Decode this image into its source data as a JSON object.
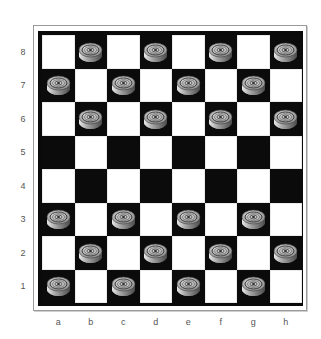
{
  "board": {
    "files": [
      "a",
      "b",
      "c",
      "d",
      "e",
      "f",
      "g",
      "h"
    ],
    "ranks": [
      "8",
      "7",
      "6",
      "5",
      "4",
      "3",
      "2",
      "1"
    ],
    "colors": {
      "light_square": "#ffffff",
      "dark_square": "#0b0b0b",
      "frame": "#9a9a9a",
      "piece_top": "#bdbdbd",
      "piece_rim": "#8a8a8a"
    },
    "pieces": [
      {
        "square": "b8",
        "type": "man"
      },
      {
        "square": "d8",
        "type": "man"
      },
      {
        "square": "f8",
        "type": "man"
      },
      {
        "square": "h8",
        "type": "man"
      },
      {
        "square": "a7",
        "type": "man"
      },
      {
        "square": "c7",
        "type": "man"
      },
      {
        "square": "e7",
        "type": "man"
      },
      {
        "square": "g7",
        "type": "man"
      },
      {
        "square": "b6",
        "type": "man"
      },
      {
        "square": "d6",
        "type": "man"
      },
      {
        "square": "f6",
        "type": "man"
      },
      {
        "square": "h6",
        "type": "man"
      },
      {
        "square": "a3",
        "type": "man"
      },
      {
        "square": "c3",
        "type": "man"
      },
      {
        "square": "e3",
        "type": "man"
      },
      {
        "square": "g3",
        "type": "man"
      },
      {
        "square": "b2",
        "type": "man"
      },
      {
        "square": "d2",
        "type": "man"
      },
      {
        "square": "f2",
        "type": "man"
      },
      {
        "square": "h2",
        "type": "man"
      },
      {
        "square": "a1",
        "type": "man"
      },
      {
        "square": "c1",
        "type": "man"
      },
      {
        "square": "e1",
        "type": "man"
      },
      {
        "square": "g1",
        "type": "man"
      }
    ],
    "piece_icon": "checker-piece-icon"
  }
}
